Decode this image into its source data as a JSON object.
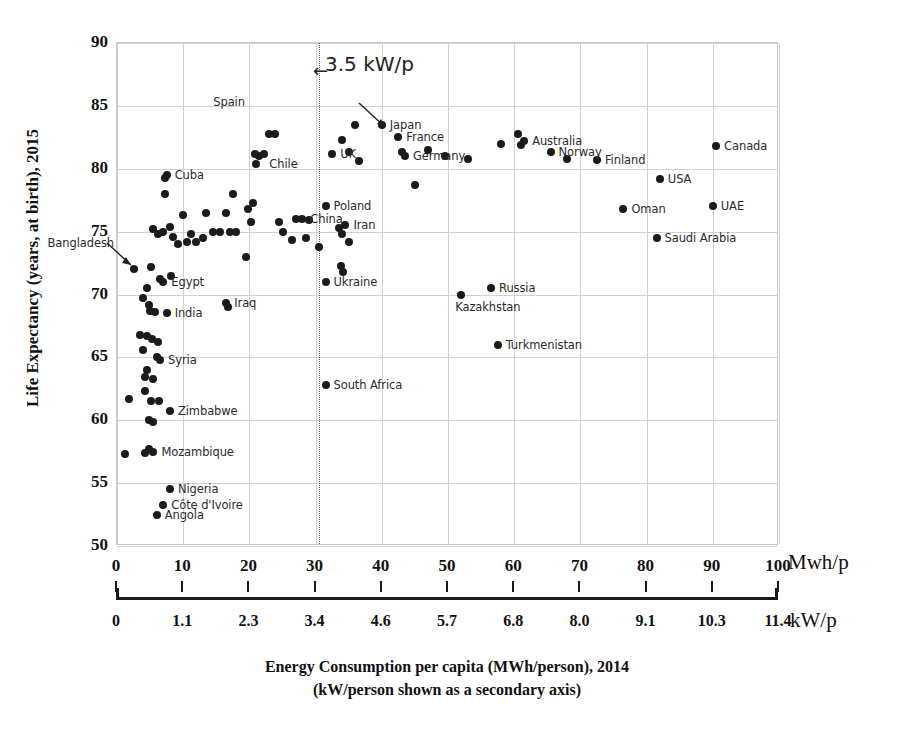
{
  "chart_data": {
    "type": "scatter",
    "title": "",
    "xlabel": "Energy Consumption per capita (MWh/person), 2014",
    "xlabel_line2": "(kW/person shown as a secondary axis)",
    "ylabel": "Life Expectancy (years, at birth), 2015",
    "xlim": [
      0,
      100
    ],
    "ylim": [
      50,
      90
    ],
    "grid": true,
    "legend": "none",
    "x_unit_primary": "Mwh/p",
    "x_unit_secondary": "kW/p",
    "x_ticks": [
      "0",
      "10",
      "20",
      "30",
      "40",
      "50",
      "60",
      "70",
      "80",
      "90",
      "100"
    ],
    "x_tick_values": [
      0,
      10,
      20,
      30,
      40,
      50,
      60,
      70,
      80,
      90,
      100
    ],
    "x_ticks_secondary": [
      "0",
      "1.1",
      "2.3",
      "3.4",
      "4.6",
      "5.7",
      "6.8",
      "8.0",
      "9.1",
      "10.3",
      "11.4"
    ],
    "y_ticks": [
      "90",
      "85",
      "80",
      "75",
      "70",
      "65",
      "60",
      "55",
      "50"
    ],
    "y_tick_values": [
      90,
      85,
      80,
      75,
      70,
      65,
      60,
      55,
      50
    ],
    "annotations": [
      {
        "text": "3.5 kW/p",
        "arrow": "←",
        "x": 30.5,
        "note": "dotted vertical threshold line"
      }
    ],
    "threshold_line_x": 30.5,
    "points": [
      {
        "x": 2.5,
        "y": 72.0,
        "label": "Bangladesh",
        "label_pos": "callout-left"
      },
      {
        "x": 7.5,
        "y": 79.5,
        "label": "Cuba",
        "label_pos": "right"
      },
      {
        "x": 23.0,
        "y": 82.8,
        "label": "Spain",
        "label_pos": "callout-up"
      },
      {
        "x": 21.5,
        "y": 81.0,
        "label": "Chile",
        "label_pos": "right-below"
      },
      {
        "x": 32.5,
        "y": 81.2,
        "label": "UK",
        "label_pos": "right"
      },
      {
        "x": 36.0,
        "y": 83.5,
        "label": "",
        "label_pos": ""
      },
      {
        "x": 40.0,
        "y": 83.5,
        "label": "Japan",
        "label_pos": "right"
      },
      {
        "x": 42.5,
        "y": 82.5,
        "label": "France",
        "label_pos": "right"
      },
      {
        "x": 43.5,
        "y": 81.0,
        "label": "Germany",
        "label_pos": "right"
      },
      {
        "x": 31.5,
        "y": 77.0,
        "label": "Poland",
        "label_pos": "right"
      },
      {
        "x": 28.0,
        "y": 76.0,
        "label": "China",
        "label_pos": "right"
      },
      {
        "x": 34.5,
        "y": 75.5,
        "label": "Iran",
        "label_pos": "right"
      },
      {
        "x": 31.5,
        "y": 71.0,
        "label": "Ukraine",
        "label_pos": "right"
      },
      {
        "x": 7.0,
        "y": 71.0,
        "label": "Egypt",
        "label_pos": "right"
      },
      {
        "x": 7.5,
        "y": 68.5,
        "label": "India",
        "label_pos": "right"
      },
      {
        "x": 16.5,
        "y": 69.3,
        "label": "Iraq",
        "label_pos": "right"
      },
      {
        "x": 6.5,
        "y": 64.8,
        "label": "Syria",
        "label_pos": "right"
      },
      {
        "x": 8.0,
        "y": 60.7,
        "label": "Zimbabwe",
        "label_pos": "right"
      },
      {
        "x": 5.5,
        "y": 57.5,
        "label": "Mozambique",
        "label_pos": "right"
      },
      {
        "x": 8.0,
        "y": 54.5,
        "label": "Nigeria",
        "label_pos": "right"
      },
      {
        "x": 7.0,
        "y": 53.3,
        "label": "Côte d'Ivoire",
        "label_pos": "right"
      },
      {
        "x": 6.0,
        "y": 52.5,
        "label": "Angola",
        "label_pos": "right"
      },
      {
        "x": 31.5,
        "y": 62.8,
        "label": "South Africa",
        "label_pos": "right"
      },
      {
        "x": 52.0,
        "y": 70.0,
        "label": "Kazakhstan",
        "label_pos": "below"
      },
      {
        "x": 56.5,
        "y": 70.5,
        "label": "Russia",
        "label_pos": "right"
      },
      {
        "x": 57.5,
        "y": 66.0,
        "label": "Turkmenistan",
        "label_pos": "right"
      },
      {
        "x": 61.5,
        "y": 82.2,
        "label": "Australia",
        "label_pos": "right"
      },
      {
        "x": 65.5,
        "y": 81.3,
        "label": "Norway",
        "label_pos": "right"
      },
      {
        "x": 72.5,
        "y": 80.7,
        "label": "Finland",
        "label_pos": "right"
      },
      {
        "x": 82.0,
        "y": 79.2,
        "label": "USA",
        "label_pos": "right"
      },
      {
        "x": 90.5,
        "y": 81.8,
        "label": "Canada",
        "label_pos": "right"
      },
      {
        "x": 76.5,
        "y": 76.8,
        "label": "Oman",
        "label_pos": "right"
      },
      {
        "x": 90.0,
        "y": 77.0,
        "label": "UAE",
        "label_pos": "right"
      },
      {
        "x": 81.5,
        "y": 74.5,
        "label": "Saudi Arabia",
        "label_pos": "right"
      },
      {
        "x": 45.0,
        "y": 78.7,
        "label": "",
        "label_pos": ""
      },
      {
        "x": 47.0,
        "y": 81.5,
        "label": "",
        "label_pos": ""
      },
      {
        "x": 49.5,
        "y": 81.0,
        "label": "",
        "label_pos": ""
      },
      {
        "x": 53.0,
        "y": 80.8,
        "label": "",
        "label_pos": ""
      },
      {
        "x": 58.0,
        "y": 82.0,
        "label": "",
        "label_pos": ""
      },
      {
        "x": 60.5,
        "y": 82.8,
        "label": "",
        "label_pos": ""
      },
      {
        "x": 61.0,
        "y": 81.9,
        "label": "",
        "label_pos": ""
      },
      {
        "x": 68.0,
        "y": 80.8,
        "label": "",
        "label_pos": ""
      },
      {
        "x": 43.0,
        "y": 81.3,
        "label": "",
        "label_pos": ""
      },
      {
        "x": 34.0,
        "y": 82.3,
        "label": "",
        "label_pos": ""
      },
      {
        "x": 35.0,
        "y": 81.3,
        "label": "",
        "label_pos": ""
      },
      {
        "x": 36.5,
        "y": 80.6,
        "label": "",
        "label_pos": ""
      },
      {
        "x": 23.8,
        "y": 82.8,
        "label": "",
        "label_pos": ""
      },
      {
        "x": 20.8,
        "y": 81.2,
        "label": "",
        "label_pos": ""
      },
      {
        "x": 21.0,
        "y": 80.4,
        "label": "",
        "label_pos": ""
      },
      {
        "x": 22.2,
        "y": 81.2,
        "label": "",
        "label_pos": ""
      },
      {
        "x": 7.2,
        "y": 79.3,
        "label": "",
        "label_pos": ""
      },
      {
        "x": 7.3,
        "y": 78.0,
        "label": "",
        "label_pos": ""
      },
      {
        "x": 17.5,
        "y": 78.0,
        "label": "",
        "label_pos": ""
      },
      {
        "x": 20.5,
        "y": 77.3,
        "label": "",
        "label_pos": ""
      },
      {
        "x": 13.5,
        "y": 76.5,
        "label": "",
        "label_pos": ""
      },
      {
        "x": 16.5,
        "y": 76.5,
        "label": "",
        "label_pos": ""
      },
      {
        "x": 20.3,
        "y": 75.8,
        "label": "",
        "label_pos": ""
      },
      {
        "x": 19.8,
        "y": 76.8,
        "label": "",
        "label_pos": ""
      },
      {
        "x": 10.0,
        "y": 76.3,
        "label": "",
        "label_pos": ""
      },
      {
        "x": 5.5,
        "y": 75.2,
        "label": "",
        "label_pos": ""
      },
      {
        "x": 6.2,
        "y": 74.8,
        "label": "",
        "label_pos": ""
      },
      {
        "x": 7.0,
        "y": 75.0,
        "label": "",
        "label_pos": ""
      },
      {
        "x": 8.0,
        "y": 75.4,
        "label": "",
        "label_pos": ""
      },
      {
        "x": 8.5,
        "y": 74.6,
        "label": "",
        "label_pos": ""
      },
      {
        "x": 9.2,
        "y": 74.0,
        "label": "",
        "label_pos": ""
      },
      {
        "x": 10.5,
        "y": 74.2,
        "label": "",
        "label_pos": ""
      },
      {
        "x": 11.2,
        "y": 74.8,
        "label": "",
        "label_pos": ""
      },
      {
        "x": 12.0,
        "y": 74.2,
        "label": "",
        "label_pos": ""
      },
      {
        "x": 13.0,
        "y": 74.5,
        "label": "",
        "label_pos": ""
      },
      {
        "x": 14.5,
        "y": 75.0,
        "label": "",
        "label_pos": ""
      },
      {
        "x": 15.5,
        "y": 75.0,
        "label": "",
        "label_pos": ""
      },
      {
        "x": 17.0,
        "y": 75.0,
        "label": "",
        "label_pos": ""
      },
      {
        "x": 18.0,
        "y": 75.0,
        "label": "",
        "label_pos": ""
      },
      {
        "x": 24.5,
        "y": 75.8,
        "label": "",
        "label_pos": ""
      },
      {
        "x": 25.0,
        "y": 75.0,
        "label": "",
        "label_pos": ""
      },
      {
        "x": 27.0,
        "y": 76.0,
        "label": "",
        "label_pos": ""
      },
      {
        "x": 29.0,
        "y": 75.9,
        "label": "",
        "label_pos": ""
      },
      {
        "x": 26.5,
        "y": 74.3,
        "label": "",
        "label_pos": ""
      },
      {
        "x": 28.5,
        "y": 74.5,
        "label": "",
        "label_pos": ""
      },
      {
        "x": 33.5,
        "y": 75.3,
        "label": "",
        "label_pos": ""
      },
      {
        "x": 34.0,
        "y": 74.8,
        "label": "",
        "label_pos": ""
      },
      {
        "x": 35.0,
        "y": 74.2,
        "label": "",
        "label_pos": ""
      },
      {
        "x": 30.5,
        "y": 73.8,
        "label": "",
        "label_pos": ""
      },
      {
        "x": 33.8,
        "y": 72.3,
        "label": "",
        "label_pos": ""
      },
      {
        "x": 34.2,
        "y": 71.8,
        "label": "",
        "label_pos": ""
      },
      {
        "x": 19.5,
        "y": 73.0,
        "label": "",
        "label_pos": ""
      },
      {
        "x": 4.5,
        "y": 70.5,
        "label": "",
        "label_pos": ""
      },
      {
        "x": 6.5,
        "y": 71.2,
        "label": "",
        "label_pos": ""
      },
      {
        "x": 8.2,
        "y": 71.5,
        "label": "",
        "label_pos": ""
      },
      {
        "x": 5.2,
        "y": 72.2,
        "label": "",
        "label_pos": ""
      },
      {
        "x": 4.0,
        "y": 69.7,
        "label": "",
        "label_pos": ""
      },
      {
        "x": 4.8,
        "y": 69.2,
        "label": "",
        "label_pos": ""
      },
      {
        "x": 5.0,
        "y": 68.7,
        "label": "",
        "label_pos": ""
      },
      {
        "x": 5.8,
        "y": 68.6,
        "label": "",
        "label_pos": ""
      },
      {
        "x": 16.8,
        "y": 69.0,
        "label": "",
        "label_pos": ""
      },
      {
        "x": 3.5,
        "y": 66.8,
        "label": "",
        "label_pos": ""
      },
      {
        "x": 4.5,
        "y": 66.7,
        "label": "",
        "label_pos": ""
      },
      {
        "x": 5.3,
        "y": 66.5,
        "label": "",
        "label_pos": ""
      },
      {
        "x": 6.2,
        "y": 66.2,
        "label": "",
        "label_pos": ""
      },
      {
        "x": 4.0,
        "y": 65.6,
        "label": "",
        "label_pos": ""
      },
      {
        "x": 6.0,
        "y": 65.0,
        "label": "",
        "label_pos": ""
      },
      {
        "x": 4.5,
        "y": 64.0,
        "label": "",
        "label_pos": ""
      },
      {
        "x": 4.3,
        "y": 63.4,
        "label": "",
        "label_pos": ""
      },
      {
        "x": 5.5,
        "y": 63.3,
        "label": "",
        "label_pos": ""
      },
      {
        "x": 4.2,
        "y": 62.3,
        "label": "",
        "label_pos": ""
      },
      {
        "x": 1.8,
        "y": 61.7,
        "label": "",
        "label_pos": ""
      },
      {
        "x": 5.2,
        "y": 61.5,
        "label": "",
        "label_pos": ""
      },
      {
        "x": 6.3,
        "y": 61.5,
        "label": "",
        "label_pos": ""
      },
      {
        "x": 4.8,
        "y": 60.0,
        "label": "",
        "label_pos": ""
      },
      {
        "x": 5.4,
        "y": 59.9,
        "label": "",
        "label_pos": ""
      },
      {
        "x": 1.2,
        "y": 57.3,
        "label": "",
        "label_pos": ""
      },
      {
        "x": 4.3,
        "y": 57.4,
        "label": "",
        "label_pos": ""
      },
      {
        "x": 4.9,
        "y": 57.7,
        "label": "",
        "label_pos": ""
      }
    ]
  }
}
